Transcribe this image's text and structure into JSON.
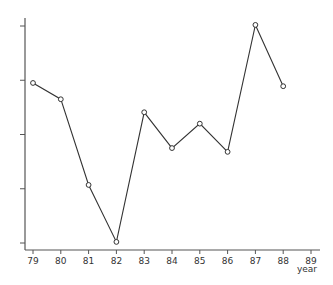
{
  "chart_data": {
    "type": "line",
    "title": "",
    "xlabel": "year",
    "ylabel": "",
    "x_ticks": [
      "79",
      "80",
      "81",
      "82",
      "83",
      "84",
      "85",
      "86",
      "87",
      "88",
      "89"
    ],
    "y_ticks": [
      "",
      "",
      "",
      "",
      ""
    ],
    "y_tick_count": 5,
    "ylim": [
      0,
      4
    ],
    "xlim": [
      79,
      89
    ],
    "grid": false,
    "legend": null,
    "series": [
      {
        "name": "series",
        "marker": "open-circle",
        "x": [
          79,
          80,
          81,
          82,
          83,
          84,
          85,
          86,
          87,
          88
        ],
        "values": [
          2.95,
          2.65,
          1.07,
          0.02,
          2.41,
          1.75,
          2.2,
          1.68,
          4.02,
          2.89
        ]
      }
    ]
  },
  "colors": {
    "line": "#333333",
    "axis": "#555555",
    "background": "#ffffff"
  }
}
